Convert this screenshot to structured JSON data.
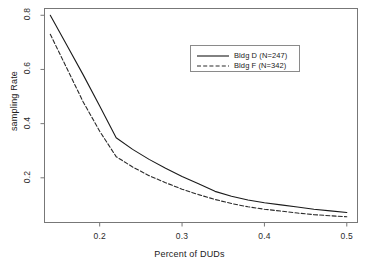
{
  "chart_data": {
    "type": "line",
    "title": "",
    "xlabel": "Percent of DUDs",
    "ylabel": "sampling Rate",
    "xlim": [
      0.133,
      0.513
    ],
    "ylim": [
      0.035,
      0.825
    ],
    "xticks": [
      0.2,
      0.3,
      0.4,
      0.5
    ],
    "xtick_labels": [
      "0.2",
      "0.3",
      "0.4",
      "0.5"
    ],
    "yticks": [
      0.2,
      0.4,
      0.6,
      0.8
    ],
    "ytick_labels": [
      "0.2",
      "0.4",
      "0.6",
      "0.8"
    ],
    "grid": false,
    "legend_position": "top-right",
    "series": [
      {
        "name": "Bldg D (N=247)",
        "style": "solid",
        "color": "#1a1a1a",
        "x": [
          0.14,
          0.16,
          0.18,
          0.2,
          0.22,
          0.24,
          0.26,
          0.28,
          0.3,
          0.32,
          0.34,
          0.36,
          0.38,
          0.4,
          0.42,
          0.44,
          0.46,
          0.48,
          0.5
        ],
        "y": [
          0.8,
          0.69,
          0.58,
          0.465,
          0.348,
          0.305,
          0.268,
          0.235,
          0.205,
          0.178,
          0.15,
          0.132,
          0.118,
          0.108,
          0.1,
          0.092,
          0.084,
          0.078,
          0.072
        ]
      },
      {
        "name": "Bldg F (N=342)",
        "style": "dashed",
        "color": "#2a2a2a",
        "x": [
          0.14,
          0.16,
          0.18,
          0.2,
          0.22,
          0.24,
          0.26,
          0.28,
          0.3,
          0.32,
          0.34,
          0.36,
          0.38,
          0.4,
          0.42,
          0.44,
          0.46,
          0.48,
          0.5
        ],
        "y": [
          0.73,
          0.605,
          0.48,
          0.372,
          0.278,
          0.24,
          0.208,
          0.182,
          0.158,
          0.138,
          0.12,
          0.105,
          0.093,
          0.084,
          0.077,
          0.07,
          0.064,
          0.06,
          0.056
        ]
      }
    ]
  },
  "legend": {
    "entries": [
      {
        "label": "Bldg D (N=247)"
      },
      {
        "label": "Bldg F (N=342)"
      }
    ]
  }
}
